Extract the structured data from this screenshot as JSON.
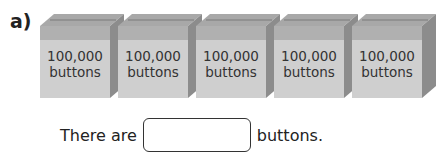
{
  "question_label": "a)",
  "boxes": [
    {
      "count": "100,000",
      "item": "buttons"
    },
    {
      "count": "100,000",
      "item": "buttons"
    },
    {
      "count": "100,000",
      "item": "buttons"
    },
    {
      "count": "100,000",
      "item": "buttons"
    },
    {
      "count": "100,000",
      "item": "buttons"
    }
  ],
  "sentence": {
    "prefix": "There are",
    "suffix": "buttons.",
    "answer_value": ""
  },
  "colors": {
    "front": "#cfcfcf",
    "band": "#b0b0b0",
    "lid": "#a8a8a8",
    "side": "#8c8c8c"
  }
}
